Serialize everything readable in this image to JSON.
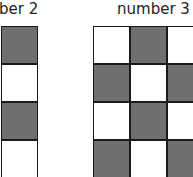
{
  "labels": {
    "left": "ber 2",
    "right": "number 3"
  },
  "colors": {
    "dark": "#6f6f6f",
    "light": "#ffffff",
    "border": "#1a1a1a"
  },
  "left_grid": [
    [
      "dark"
    ],
    [
      "light"
    ],
    [
      "dark"
    ],
    [
      "light"
    ]
  ],
  "right_grid": [
    [
      "light",
      "dark",
      "light"
    ],
    [
      "dark",
      "light",
      "dark"
    ],
    [
      "light",
      "dark",
      "light"
    ],
    [
      "dark",
      "light",
      "dark"
    ]
  ]
}
